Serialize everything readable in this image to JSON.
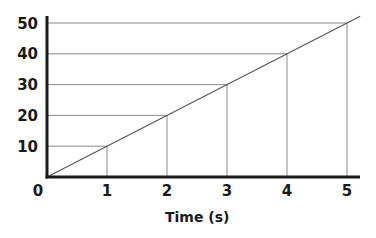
{
  "chart_data": {
    "type": "line",
    "title": "",
    "xlabel": "Time (s)",
    "ylabel": "",
    "x": [
      0,
      1,
      2,
      3,
      4,
      5
    ],
    "series": [
      {
        "name": "distance",
        "values": [
          0,
          10,
          20,
          30,
          40,
          50
        ]
      }
    ],
    "x_ticks": [
      "0",
      "1",
      "2",
      "3",
      "4",
      "5"
    ],
    "y_ticks": [
      "10",
      "20",
      "30",
      "40",
      "50"
    ],
    "xlim": [
      0,
      5.2
    ],
    "ylim": [
      0,
      52
    ],
    "grid": false,
    "guide_lines": "projection lines from each data point to both axes",
    "legend": null
  }
}
